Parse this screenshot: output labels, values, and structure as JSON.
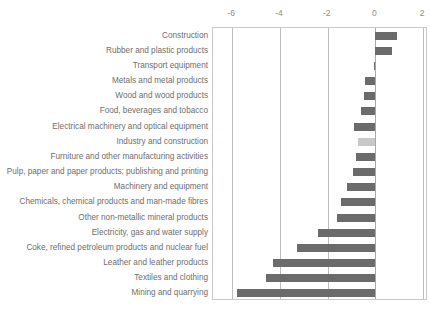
{
  "chart_data": {
    "type": "bar",
    "orientation": "horizontal",
    "title": "",
    "title_fragment": "",
    "xlabel": "",
    "ylabel": "",
    "xlim": [
      -6.8,
      2.2
    ],
    "xticks": [
      -6,
      -4,
      -2,
      0,
      2
    ],
    "xtick_labels": [
      "-6",
      "-4",
      "-2",
      "0",
      "2"
    ],
    "grid": true,
    "gridlines_at": [
      -6,
      -4,
      -2,
      0,
      2
    ],
    "legend": "none",
    "colors": {
      "bar_default": "#6b6b6b",
      "bar_highlight": "#c8c8c8",
      "gridline": "#bdbdbd",
      "frame": "#c9c9c9",
      "text": "#6e6e6e",
      "tick_text": "#8c8c8c"
    },
    "categories": [
      "Construction",
      "Rubber and plastic products",
      "Transport equipment",
      "Metals and metal products",
      "Wood and wood products",
      "Food, beverages and tobacco",
      "Electrical machinery and optical equipment",
      "Industry and construction",
      "Furniture and other manufacturing activities",
      "Pulp, paper and paper products; publishing and printing",
      "Machinery and equipment",
      "Chemicals, chemical products and man-made fibres",
      "Other non-metallic mineral products",
      "Electricity, gas and water supply",
      "Coke, refined petroleum products and nuclear fuel",
      "Leather and leather products",
      "Textiles and clothing",
      "Mining and quarrying"
    ],
    "values": [
      0.9,
      0.7,
      -0.05,
      -0.45,
      -0.5,
      -0.6,
      -0.9,
      -0.75,
      -0.8,
      -0.95,
      -1.2,
      -1.45,
      -1.6,
      -2.4,
      -3.3,
      -4.3,
      -4.6,
      -5.8
    ],
    "highlight_categories": [
      "Industry and construction"
    ]
  }
}
